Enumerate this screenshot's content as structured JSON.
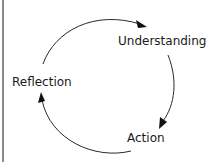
{
  "diagram": {
    "type": "cycle",
    "direction": "clockwise",
    "nodes": [
      {
        "id": "understanding",
        "label": "Understanding"
      },
      {
        "id": "action",
        "label": "Action"
      },
      {
        "id": "reflection",
        "label": "Reflection"
      }
    ],
    "edges": [
      {
        "from": "reflection",
        "to": "understanding"
      },
      {
        "from": "understanding",
        "to": "action"
      },
      {
        "from": "action",
        "to": "reflection"
      }
    ]
  },
  "colors": {
    "line": "#2a2a2a",
    "text": "#1a1a1a",
    "border": "#8a8a8a"
  }
}
